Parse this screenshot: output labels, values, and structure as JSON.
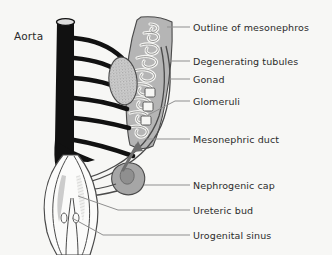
{
  "figure": {
    "title_label": "Aorta",
    "background_color": "#f7f7f5",
    "ink_color": "#2b2b2b",
    "leader_color": "#8a8a8a",
    "aorta_color": "#111111",
    "mesonephros_fill": "#b8b8b8",
    "gonad_fill": "#c8c8c8",
    "nephrogenic_cap_fill": "#a8a8a8",
    "tubule_fill": "#f2f2f0"
  },
  "labels": [
    {
      "id": "outline-of-mesonephros",
      "text": "Outline of mesonephros",
      "x": 193,
      "y": 23
    },
    {
      "id": "degenerating-tubules",
      "text": "Degenerating tubules",
      "x": 193,
      "y": 57
    },
    {
      "id": "gonad",
      "text": "Gonad",
      "x": 193,
      "y": 75
    },
    {
      "id": "glomeruli",
      "text": "Glomeruli",
      "x": 193,
      "y": 97
    },
    {
      "id": "mesonephric-duct",
      "text": "Mesonephric duct",
      "x": 193,
      "y": 135
    },
    {
      "id": "nephrogenic-cap",
      "text": "Nephrogenic cap",
      "x": 193,
      "y": 181
    },
    {
      "id": "ureteric-bud",
      "text": "Ureteric bud",
      "x": 193,
      "y": 206
    },
    {
      "id": "urogenital-sinus",
      "text": "Urogenital sinus",
      "x": 193,
      "y": 231
    }
  ],
  "aorta": {
    "label": "Aorta",
    "label_x": 14,
    "label_y": 30,
    "branch_count": 6
  },
  "structures": [
    {
      "id": "aorta",
      "name": "Aorta"
    },
    {
      "id": "segmental-arteries",
      "name": "Segmental arteries"
    },
    {
      "id": "mesonephros",
      "name": "Mesonephros"
    },
    {
      "id": "gonad",
      "name": "Gonad"
    },
    {
      "id": "glomeruli",
      "name": "Glomeruli"
    },
    {
      "id": "mesonephric-duct",
      "name": "Mesonephric duct"
    },
    {
      "id": "nephrogenic-cap",
      "name": "Nephrogenic cap"
    },
    {
      "id": "ureteric-bud",
      "name": "Ureteric bud"
    },
    {
      "id": "urogenital-sinus",
      "name": "Urogenital sinus"
    },
    {
      "id": "growth-arrow",
      "name": "Growth direction arrow"
    }
  ]
}
